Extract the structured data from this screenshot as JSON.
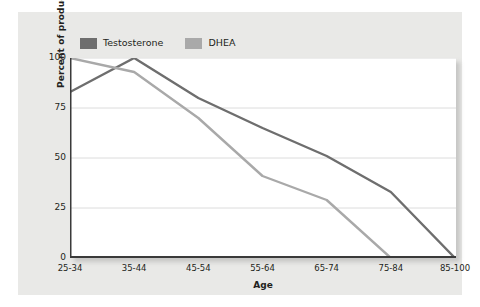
{
  "chart_data": {
    "type": "line",
    "title": "",
    "xlabel": "Age",
    "ylabel": "Percent of production in men",
    "categories": [
      "25-34",
      "35-44",
      "45-54",
      "55-64",
      "65-74",
      "75-84",
      "85-100"
    ],
    "yticks": [
      0,
      25,
      50,
      75,
      100
    ],
    "ylim": [
      0,
      100
    ],
    "grid": true,
    "legend_position": "top-left",
    "series": [
      {
        "name": "Testosterone",
        "color": "#6e6e6e",
        "values": [
          83,
          100,
          80,
          65,
          51,
          33,
          0
        ]
      },
      {
        "name": "DHEA",
        "color": "#a9a9a9",
        "values": [
          100,
          93,
          70,
          41,
          29,
          0,
          0
        ]
      }
    ]
  },
  "figure": {
    "background_color": "#e9e9e7",
    "plot_background_color": "#ffffff",
    "axis_color": "#3a3a3a",
    "grid_color": "#dcdcdc",
    "text_color": "#231f20"
  }
}
